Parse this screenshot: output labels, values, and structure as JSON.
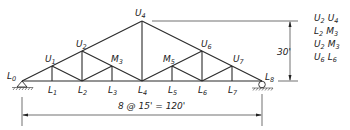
{
  "diagram": {
    "type": "roof truss",
    "nodes": {
      "L0": {
        "x": 22,
        "y": 81,
        "label": "L",
        "sub": "0"
      },
      "L1": {
        "x": 52,
        "y": 81,
        "label": "L",
        "sub": "1"
      },
      "L2": {
        "x": 82,
        "y": 81,
        "label": "L",
        "sub": "2"
      },
      "L3": {
        "x": 112,
        "y": 81,
        "label": "L",
        "sub": "3"
      },
      "L4": {
        "x": 142,
        "y": 81,
        "label": "L",
        "sub": "4"
      },
      "L5": {
        "x": 172,
        "y": 81,
        "label": "L",
        "sub": "5"
      },
      "L6": {
        "x": 202,
        "y": 81,
        "label": "L",
        "sub": "6"
      },
      "L7": {
        "x": 232,
        "y": 81,
        "label": "L",
        "sub": "7"
      },
      "L8": {
        "x": 262,
        "y": 81,
        "label": "L",
        "sub": "8"
      },
      "U1": {
        "x": 52,
        "y": 66,
        "label": "U",
        "sub": "1"
      },
      "U2": {
        "x": 82,
        "y": 51,
        "label": "U",
        "sub": "2"
      },
      "M3": {
        "x": 112,
        "y": 66,
        "label": "M",
        "sub": "3"
      },
      "U4": {
        "x": 142,
        "y": 21,
        "label": "U",
        "sub": "4"
      },
      "M5": {
        "x": 172,
        "y": 66,
        "label": "M",
        "sub": "5"
      },
      "U6": {
        "x": 202,
        "y": 51,
        "label": "U",
        "sub": "6"
      },
      "U7": {
        "x": 232,
        "y": 66,
        "label": "U",
        "sub": "7"
      }
    },
    "labels": {
      "L0": "L",
      "L0s": "0",
      "L1": "L",
      "L1s": "1",
      "L2": "L",
      "L2s": "2",
      "L3": "L",
      "L3s": "3",
      "L4": "L",
      "L4s": "4",
      "L5": "L",
      "L5s": "5",
      "L6": "L",
      "L6s": "6",
      "L7": "L",
      "L7s": "7",
      "L8": "L",
      "L8s": "8",
      "U1": "U",
      "U1s": "1",
      "U2": "U",
      "U2s": "2",
      "M3": "M",
      "M3s": "3",
      "U4": "U",
      "U4s": "4",
      "M5": "M",
      "M5s": "5",
      "U6": "U",
      "U6s": "6",
      "U7": "U",
      "U7s": "7"
    },
    "supports": {
      "left": "pin",
      "right": "roller"
    },
    "dimensions": {
      "span": "8 @ 15' = 120'",
      "height": "30'"
    },
    "member_list": [
      {
        "a": "U",
        "as": "2",
        "b": "U",
        "bs": "4"
      },
      {
        "a": "L",
        "as": "2",
        "b": "M",
        "bs": "3"
      },
      {
        "a": "U",
        "as": "2",
        "b": "M",
        "bs": "3"
      },
      {
        "a": "U",
        "as": "6",
        "b": "L",
        "bs": "6"
      }
    ]
  }
}
